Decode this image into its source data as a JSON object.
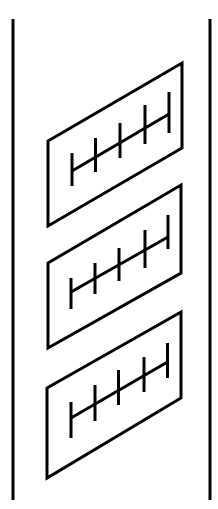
{
  "diagram": {
    "canvas": {
      "width": 218,
      "height": 509,
      "background": "#ffffff"
    },
    "stroke_color": "#000000",
    "stroke_width": 3,
    "vertical_lines": [
      {
        "name": "left-boundary-line",
        "x": 13,
        "y1": 19,
        "y2": 500
      },
      {
        "name": "right-boundary-line",
        "x": 210,
        "y1": 19,
        "y2": 500
      }
    ],
    "panels": [
      {
        "name": "panel-1",
        "corners": [
          [
            48,
            141
          ],
          [
            182,
            63
          ],
          [
            182,
            148
          ],
          [
            48,
            226
          ]
        ],
        "ruler": {
          "line": [
            [
              72,
              171
            ],
            [
              169,
              114
            ]
          ],
          "ticks": [
            {
              "x": 72,
              "y1": 153,
              "y2": 186
            },
            {
              "x": 95.5,
              "y1": 138,
              "y2": 172
            },
            {
              "x": 120,
              "y1": 123,
              "y2": 158
            },
            {
              "x": 145,
              "y1": 105,
              "y2": 144
            },
            {
              "x": 169,
              "y1": 92,
              "y2": 133
            }
          ]
        }
      },
      {
        "name": "panel-2",
        "corners": [
          [
            48,
            263
          ],
          [
            181,
            185
          ],
          [
            181,
            273
          ],
          [
            48,
            348
          ]
        ],
        "ruler": {
          "line": [
            [
              71,
              292
            ],
            [
              168,
              237
            ]
          ],
          "ticks": [
            {
              "x": 71,
              "y1": 278,
              "y2": 309
            },
            {
              "x": 95,
              "y1": 263,
              "y2": 294
            },
            {
              "x": 119,
              "y1": 248,
              "y2": 281
            },
            {
              "x": 145,
              "y1": 230,
              "y2": 268
            },
            {
              "x": 168,
              "y1": 215,
              "y2": 249
            }
          ]
        }
      },
      {
        "name": "panel-3",
        "corners": [
          [
            47,
            388
          ],
          [
            181,
            312
          ],
          [
            181,
            398
          ],
          [
            47,
            478
          ]
        ],
        "ruler": {
          "line": [
            [
              71,
              418
            ],
            [
              167.5,
              362
            ]
          ],
          "ticks": [
            {
              "x": 71,
              "y1": 402,
              "y2": 438
            },
            {
              "x": 95,
              "y1": 385,
              "y2": 421
            },
            {
              "x": 118.5,
              "y1": 370,
              "y2": 405
            },
            {
              "x": 144,
              "y1": 357,
              "y2": 392
            },
            {
              "x": 167.5,
              "y1": 343,
              "y2": 378
            }
          ]
        }
      }
    ]
  }
}
